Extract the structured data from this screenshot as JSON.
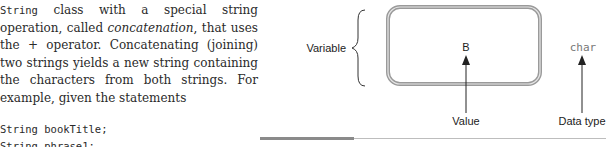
{
  "prose": {
    "seg1_code": "String",
    "seg2": " class with a special string operation, called ",
    "seg3_em": "concatenation",
    "seg4": ", that uses the + operator. Concatenating (joining) two strings yields a new string containing the characters from both strings. For example, given the statements"
  },
  "code_lines": [
    "String bookTitle;",
    "String phrase1;"
  ],
  "figure": {
    "variable_label": "Variable",
    "value_text": "B",
    "type_text": "char",
    "value_label": "Value",
    "type_label": "Data type"
  }
}
